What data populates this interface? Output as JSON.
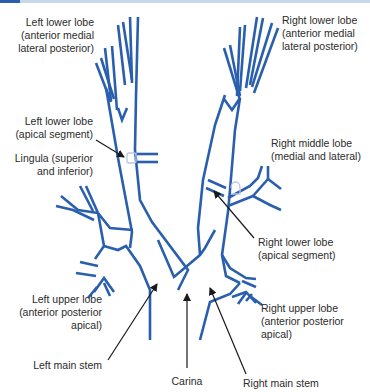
{
  "diagram": {
    "colors": {
      "airway": "#2a5fad",
      "arrow": "#1a1a1a",
      "text": "#2b2b2b",
      "segment_marker": "#b9c8e2",
      "topbar": "#c9d7ea",
      "topbar_accent": "#2a5fad"
    },
    "labels": {
      "left_lower_lobe_amlp": [
        "Left lower lobe",
        "(anterior medial",
        "lateral posterior)"
      ],
      "right_lower_lobe_amlp": [
        "Right lower lobe",
        "(anterior medial",
        "lateral posterior)"
      ],
      "left_lower_lobe_apical": [
        "Left lower lobe",
        "(apical segment)"
      ],
      "lingula": [
        "Lingula (superior",
        "and inferior)"
      ],
      "right_middle_lobe": [
        "Right middle lobe",
        "(medial and lateral)"
      ],
      "right_lower_lobe_apical": [
        "Right lower lobe",
        "(apical segment)"
      ],
      "left_upper_lobe": [
        "Left upper lobe",
        "(anterior posterior",
        "apical)"
      ],
      "right_upper_lobe": [
        "Right upper lobe",
        "(anterior posterior",
        "apical)"
      ],
      "left_main_stem": [
        "Left main stem"
      ],
      "carina": [
        "Carina"
      ],
      "right_main_stem": [
        "Right main stem"
      ]
    }
  }
}
